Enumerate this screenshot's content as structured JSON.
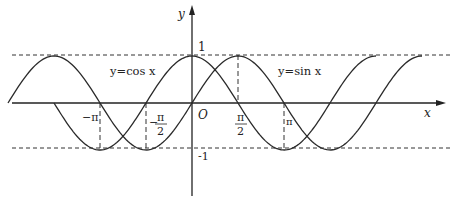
{
  "diagram": {
    "axes": {
      "x_label": "x",
      "y_label": "y",
      "origin_label": "O",
      "y_tick_top": "1",
      "y_tick_bottom": "-1"
    },
    "curves": [
      {
        "name": "sine",
        "label": "y=sin x"
      },
      {
        "name": "cosine",
        "label": "y=cos x"
      }
    ],
    "x_ticks": {
      "neg_pi": "−π",
      "neg_half_pi_sign": "−",
      "pi_num": "π",
      "half_den": "2",
      "pi": "π"
    },
    "colors": {
      "stroke": "#2a2a2a",
      "background": "#ffffff"
    }
  }
}
